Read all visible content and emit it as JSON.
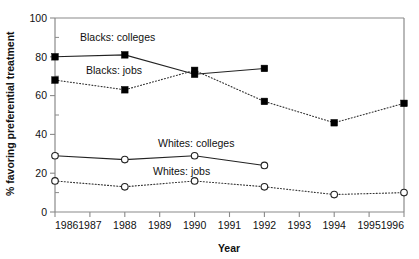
{
  "chart_data": {
    "type": "line",
    "title": "",
    "xlabel": "Year",
    "ylabel": "% favoring preferential treatment",
    "xlim": [
      1986,
      1996
    ],
    "ylim": [
      0,
      100
    ],
    "xticks": [
      1986,
      1987,
      1988,
      1989,
      1990,
      1991,
      1992,
      1993,
      1994,
      1995,
      1996
    ],
    "xticklabels": [
      "1986",
      "1987",
      "1988",
      "1989",
      "1990",
      "1991",
      "1992",
      "1993",
      "1994",
      "1995",
      "1996"
    ],
    "yticks": [
      0,
      20,
      40,
      60,
      80,
      100
    ],
    "yticklabels": [
      "0",
      "20",
      "40",
      "60",
      "80",
      "100"
    ],
    "y_minor_ticks": [
      10,
      30,
      50,
      70,
      90
    ],
    "grid": false,
    "legend_position": "inline-annotations",
    "series": [
      {
        "name": "Blacks: colleges",
        "marker": "filled-square",
        "line": "solid",
        "x": [
          1986,
          1988,
          1990,
          1992
        ],
        "values": [
          80,
          81,
          71,
          74
        ]
      },
      {
        "name": "Blacks: jobs",
        "marker": "filled-square",
        "line": "dotted",
        "x": [
          1986,
          1988,
          1990,
          1992,
          1994,
          1996
        ],
        "values": [
          68,
          63,
          73,
          57,
          46,
          56
        ]
      },
      {
        "name": "Whites: colleges",
        "marker": "open-circle",
        "line": "solid",
        "x": [
          1986,
          1988,
          1990,
          1992
        ],
        "values": [
          29,
          27,
          29,
          24
        ]
      },
      {
        "name": "Whites: jobs",
        "marker": "open-circle",
        "line": "dotted",
        "x": [
          1986,
          1988,
          1990,
          1992,
          1994,
          1996
        ],
        "values": [
          16,
          13,
          16,
          13,
          9,
          10
        ]
      }
    ],
    "annotations": [
      {
        "text": "Blacks: colleges",
        "x_px": 80,
        "y_px": 41
      },
      {
        "text": "Blacks: jobs",
        "x_px": 86,
        "y_px": 74
      },
      {
        "text": "Whites: colleges",
        "x_px": 158,
        "y_px": 147
      },
      {
        "text": "Whites: jobs",
        "x_px": 153,
        "y_px": 175
      }
    ]
  }
}
